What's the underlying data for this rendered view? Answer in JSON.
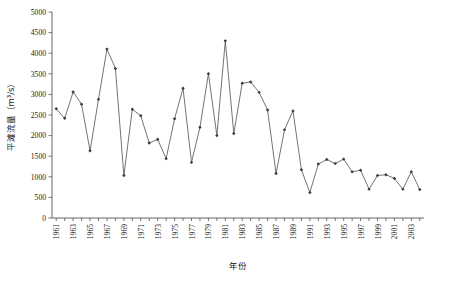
{
  "chart_data": {
    "type": "line",
    "title": "",
    "xlabel": "年份",
    "ylabel": "平滩流量（m³/s）",
    "xlim": [
      1960.5,
      2004.5
    ],
    "ylim": [
      0,
      5000
    ],
    "ytick_step": 500,
    "xtick_step": 2,
    "grid": false,
    "legend": null,
    "marker": "filled-diamond",
    "line_color": "#5a5a5a",
    "marker_color": "#3b3b3b",
    "yticks": [
      "0",
      "500",
      "1000",
      "1500",
      "2000",
      "2500",
      "3000",
      "3500",
      "4000",
      "4500",
      "5000"
    ],
    "xticks": [
      "1961",
      "1963",
      "1965",
      "1967",
      "1969",
      "1971",
      "1973",
      "1975",
      "1977",
      "1979",
      "1981",
      "1983",
      "1985",
      "1987",
      "1989",
      "1991",
      "1993",
      "1995",
      "1997",
      "1999",
      "2001",
      "2003"
    ],
    "x": [
      1961,
      1962,
      1963,
      1964,
      1965,
      1966,
      1967,
      1968,
      1969,
      1970,
      1971,
      1972,
      1973,
      1974,
      1975,
      1976,
      1977,
      1978,
      1979,
      1980,
      1981,
      1982,
      1983,
      1984,
      1985,
      1986,
      1987,
      1988,
      1989,
      1990,
      1991,
      1992,
      1993,
      1994,
      1995,
      1996,
      1997,
      1998,
      1999,
      2000,
      2001,
      2002,
      2003,
      2004
    ],
    "values": [
      2650,
      2420,
      3060,
      2760,
      1630,
      2880,
      4100,
      3630,
      1030,
      2640,
      2480,
      1820,
      1910,
      1440,
      2410,
      3150,
      1350,
      2200,
      3500,
      2000,
      4300,
      2050,
      3270,
      3300,
      3050,
      2620,
      1080,
      2140,
      2600,
      1170,
      620,
      1310,
      1420,
      1320,
      1430,
      1120,
      1160,
      700,
      1030,
      1050,
      960,
      700,
      1120,
      690
    ],
    "series_name": "平滩流量"
  },
  "caption": ""
}
